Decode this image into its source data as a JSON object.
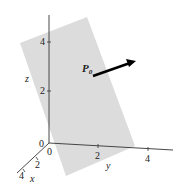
{
  "figure": {
    "type": "3d-plane-with-normal-vector",
    "plane_color": "#dcdcdc",
    "axis_color": "#333333",
    "vector_color": "#000000",
    "point_label": "P",
    "point_subscript": "0",
    "axes": {
      "x": {
        "label": "x",
        "ticks": [
          "0",
          "2",
          "4"
        ]
      },
      "y": {
        "label": "y",
        "ticks": [
          "0",
          "2",
          "4"
        ]
      },
      "z": {
        "label": "z",
        "ticks": [
          "0",
          "2",
          "4"
        ]
      }
    }
  }
}
